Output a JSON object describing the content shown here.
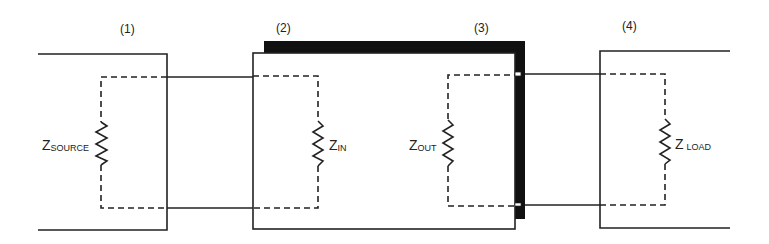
{
  "diagram": {
    "stage_labels": [
      "(1)",
      "(2)",
      "(3)",
      "(4)"
    ],
    "impedances": [
      {
        "symbol": "Z",
        "subscript": "SOURCE"
      },
      {
        "symbol": "Z",
        "subscript": "IN"
      },
      {
        "symbol": "Z",
        "subscript": "OUT"
      },
      {
        "symbol": "Z",
        "subscript": "LOAD"
      }
    ],
    "colors": {
      "line": "#222222",
      "shadow": "#111111",
      "background": "#ffffff"
    }
  }
}
